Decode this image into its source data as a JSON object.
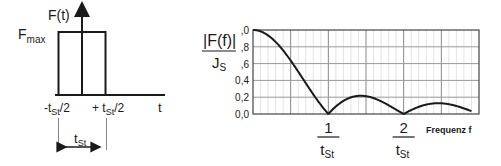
{
  "left_diagram": {
    "y_axis_label": "F(t)",
    "level_label_main": "F",
    "level_label_sub": "max",
    "x_axis_label": "t",
    "left_edge_label": {
      "pre": "-t",
      "sub": "St",
      "post": "/2"
    },
    "right_edge_label": {
      "pre": "+ t",
      "sub": "St",
      "post": "/2"
    },
    "width_label": {
      "main": "t",
      "sub": "St"
    }
  },
  "chart_data": {
    "type": "line",
    "title": "",
    "ylabel": {
      "numerator": "|F(f)|",
      "denominator_main": "J",
      "denominator_sub": "S"
    },
    "xlabel": "Frequenz f",
    "xlim": [
      0,
      3
    ],
    "ylim": [
      0,
      1.0
    ],
    "yticks": [
      1.0,
      0.8,
      0.6,
      0.4,
      0.2,
      0.0
    ],
    "ytick_labels": [
      ",0",
      ",8",
      ",6",
      "0,4",
      "0,2",
      "0,0"
    ],
    "xticks": [
      1,
      2
    ],
    "xtick_labels": [
      {
        "numerator": "1",
        "den_main": "t",
        "den_sub": "St"
      },
      {
        "numerator": "2",
        "den_main": "t",
        "den_sub": "St"
      }
    ],
    "grid": true,
    "function": "|sinc(f·t_St)|",
    "series": [
      {
        "name": "|F(f)|/J_S",
        "x": [
          0,
          0.25,
          0.5,
          0.75,
          1.0,
          1.25,
          1.5,
          1.75,
          2.0,
          2.25,
          2.5,
          2.75,
          2.9
        ],
        "y": [
          1.0,
          0.9,
          0.64,
          0.3,
          0.0,
          0.18,
          0.21,
          0.13,
          0.0,
          0.1,
          0.13,
          0.08,
          0.03
        ]
      }
    ]
  }
}
